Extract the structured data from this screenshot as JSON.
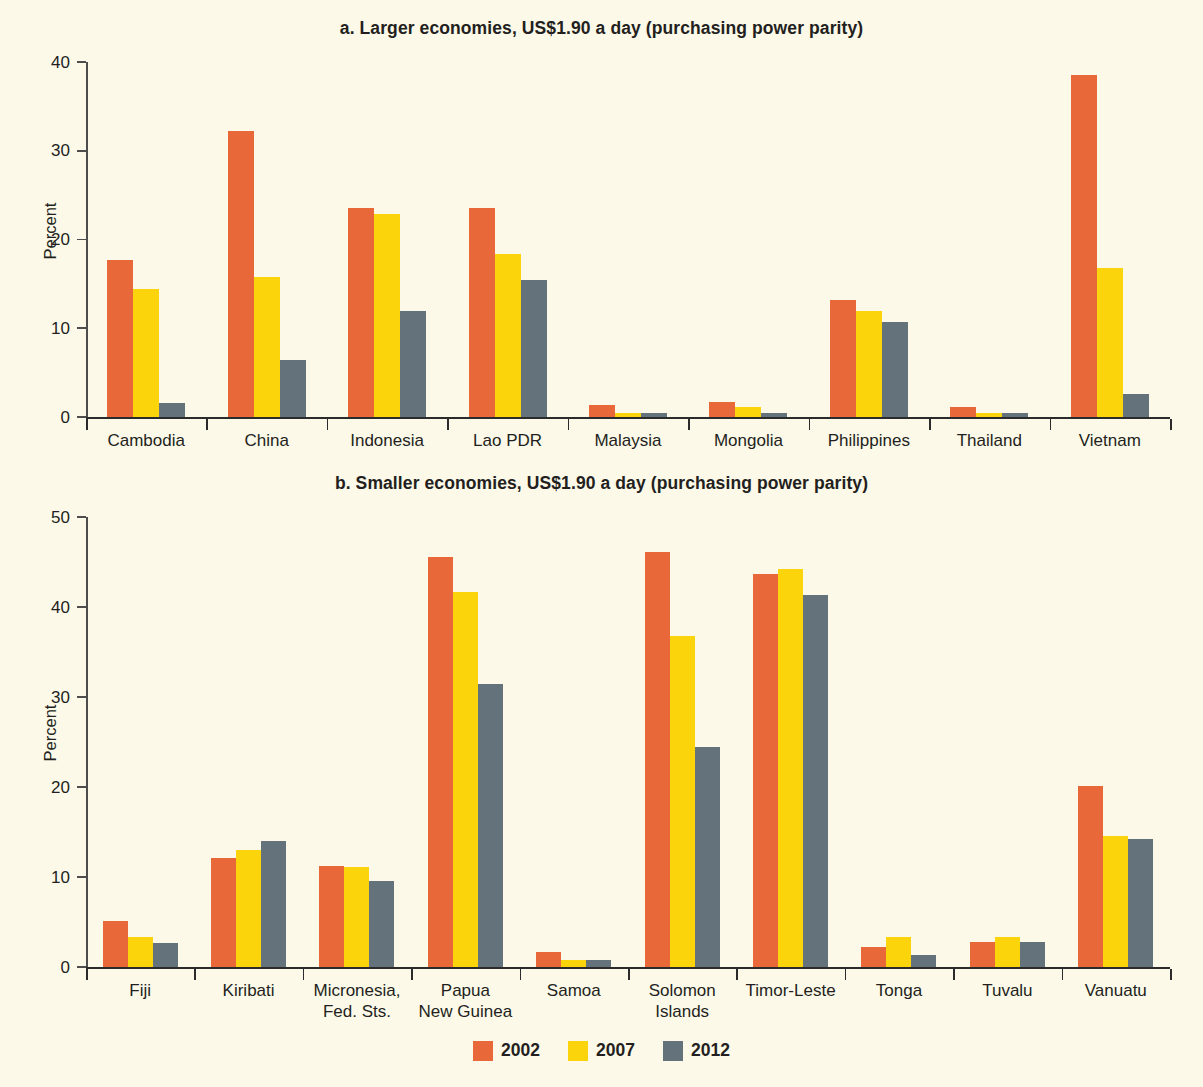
{
  "colors": {
    "background": "#FCF9E9",
    "s2002": "#E8683A",
    "s2007": "#FBD40C",
    "s2012": "#64727C",
    "axis": "#2B2B2B",
    "text": "#231F20"
  },
  "legend": {
    "items": [
      {
        "label": "2002",
        "color": "#E8683A",
        "swatch_name": "legend-swatch-2002"
      },
      {
        "label": "2007",
        "color": "#FBD40C",
        "swatch_name": "legend-swatch-2007"
      },
      {
        "label": "2012",
        "color": "#64727C",
        "swatch_name": "legend-swatch-2012"
      }
    ]
  },
  "panel_a": {
    "title": "a. Larger economies, US$1.90 a day (purchasing power parity)",
    "ylabel": "Percent",
    "yticks": [
      "0",
      "10",
      "20",
      "30",
      "40"
    ]
  },
  "panel_b": {
    "title": "b. Smaller economies, US$1.90 a day (purchasing power parity)",
    "ylabel": "Percent",
    "yticks": [
      "0",
      "10",
      "20",
      "30",
      "40",
      "50"
    ]
  },
  "chart_data": [
    {
      "type": "bar",
      "title": "a. Larger economies, US$1.90 a day (purchasing power parity)",
      "xlabel": "",
      "ylabel": "Percent",
      "ylim": [
        0,
        40
      ],
      "ytick_step": 10,
      "grid": false,
      "legend_position": "bottom-center-shared",
      "categories": [
        "Cambodia",
        "China",
        "Indonesia",
        "Lao PDR",
        "Malaysia",
        "Mongolia",
        "Philippines",
        "Thailand",
        "Vietnam"
      ],
      "series": [
        {
          "name": "2002",
          "color": "#E8683A",
          "values": [
            17.7,
            32.2,
            23.5,
            23.5,
            1.4,
            1.7,
            13.2,
            1.1,
            38.5
          ]
        },
        {
          "name": "2007",
          "color": "#FBD40C",
          "values": [
            14.4,
            15.8,
            22.9,
            18.4,
            0.4,
            1.1,
            11.9,
            0.5,
            16.8
          ]
        },
        {
          "name": "2012",
          "color": "#64727C",
          "values": [
            1.6,
            6.4,
            11.9,
            15.4,
            0.4,
            0.4,
            10.7,
            0.4,
            2.6
          ]
        }
      ]
    },
    {
      "type": "bar",
      "title": "b. Smaller economies, US$1.90 a day (purchasing power parity)",
      "xlabel": "",
      "ylabel": "Percent",
      "ylim": [
        0,
        50
      ],
      "ytick_step": 10,
      "grid": false,
      "legend_position": "bottom-center-shared",
      "categories": [
        "Fiji",
        "Kiribati",
        "Micronesia,\nFed. Sts.",
        "Papua\nNew Guinea",
        "Samoa",
        "Solomon\nIslands",
        "Timor-Leste",
        "Tonga",
        "Tuvalu",
        "Vanuatu"
      ],
      "series": [
        {
          "name": "2002",
          "color": "#E8683A",
          "values": [
            5.1,
            12.1,
            11.2,
            45.6,
            1.7,
            46.1,
            43.7,
            2.2,
            2.8,
            20.1
          ]
        },
        {
          "name": "2007",
          "color": "#FBD40C",
          "values": [
            3.3,
            13.0,
            11.1,
            41.7,
            0.8,
            36.8,
            44.2,
            3.3,
            3.3,
            14.6
          ]
        },
        {
          "name": "2012",
          "color": "#64727C",
          "values": [
            2.7,
            14.0,
            9.6,
            31.4,
            0.8,
            24.4,
            41.3,
            1.3,
            2.8,
            14.2
          ]
        }
      ]
    }
  ]
}
